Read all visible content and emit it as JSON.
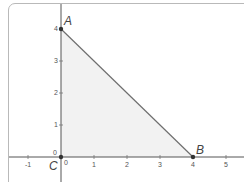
{
  "diagram": {
    "type": "coordinate-plane-triangle",
    "points": [
      {
        "label": "A",
        "x": 0,
        "y": 4
      },
      {
        "label": "B",
        "x": 4,
        "y": 0
      },
      {
        "label": "C",
        "x": 0,
        "y": 0
      }
    ],
    "x_axis": {
      "ticks": [
        "-1",
        "0",
        "1",
        "2",
        "3",
        "4",
        "5"
      ]
    },
    "y_axis": {
      "ticks": [
        "0",
        "1",
        "2",
        "3",
        "4"
      ]
    },
    "colors": {
      "fill": "#f2f2f2",
      "edge": "#6e6e6e",
      "axis": "#555555",
      "point": "#333333",
      "frame": "#b9b9b9"
    }
  }
}
